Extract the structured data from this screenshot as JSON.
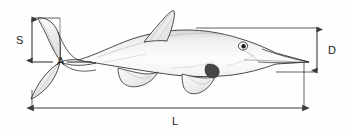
{
  "diagram": {
    "background_color": "#fefefe",
    "outline_color": "#2b2b2b",
    "dimension_line_color": "#3a3a3a",
    "shading_color": "#454545",
    "labels": {
      "S": "S",
      "A": "A",
      "D": "D",
      "L": "L"
    },
    "measurements": [
      {
        "id": "S",
        "label": "S",
        "kind": "vertical-double-arrow",
        "description": "Height of upper caudal (tail) fin lobe",
        "x": 32,
        "y_top": 18,
        "y_bottom": 62
      },
      {
        "id": "A",
        "label": "A",
        "kind": "horizontal-leader",
        "description": "Caudal peduncle reference line",
        "y": 62,
        "x_start": 32,
        "x_end": 86
      },
      {
        "id": "D",
        "label": "D",
        "kind": "vertical-double-arrow",
        "description": "Body depth at head / trunk",
        "x": 317,
        "y_top": 28,
        "y_bottom": 72
      },
      {
        "id": "L",
        "label": "L",
        "kind": "horizontal-double-arrow",
        "description": "Total body length from tail tip to snout tip",
        "y": 108,
        "x_start": 32,
        "x_end": 304
      }
    ],
    "anatomy_parts": [
      "caudal-fin",
      "caudal-peduncle",
      "dorsal-fin",
      "pectoral-flipper",
      "pelvic-flipper",
      "trunk",
      "head",
      "rostrum",
      "eye"
    ]
  }
}
